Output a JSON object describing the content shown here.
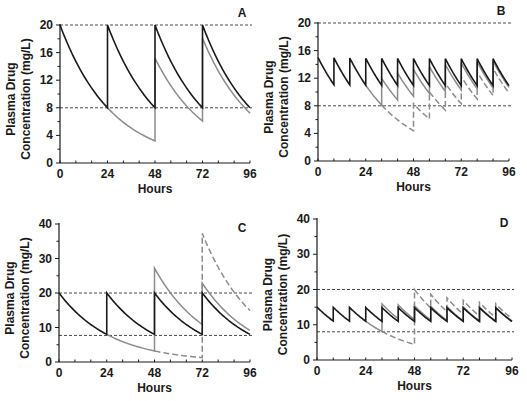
{
  "figure": {
    "width": 527,
    "height": 401,
    "colors": {
      "axis": "#1a1a1a",
      "primary": "#1a1a1a",
      "secondary": "#8c8c8c",
      "reference": "#333333"
    }
  },
  "chart_data": [
    {
      "panel": "A",
      "type": "line",
      "title": "A",
      "xlabel": "Hours",
      "ylabel": [
        "Plasma Drug",
        "Concentration (mg/L)"
      ],
      "xlim": [
        0,
        96
      ],
      "ylim": [
        0,
        20
      ],
      "xticks": [
        0,
        24,
        48,
        72,
        96
      ],
      "yticks": [
        0,
        4,
        8,
        12,
        16,
        20
      ],
      "x_minor_step": 8,
      "y_minor_step": 2,
      "reference_lines": [
        20,
        8
      ],
      "elimination_rate_per_h": 0.03818,
      "series": [
        {
          "name": "Regular dosing every 24 h",
          "color": "primary",
          "style": "solid",
          "initial": 20,
          "doses": [
            {
              "t": 24,
              "amount": 12
            },
            {
              "t": 48,
              "amount": 12
            },
            {
              "t": 72,
              "amount": 12
            }
          ]
        },
        {
          "name": "Missed dose at 24 h",
          "color": "secondary",
          "style": "solid",
          "initial": 20,
          "start": 24,
          "doses": [
            {
              "t": 48,
              "amount": 12
            },
            {
              "t": 72,
              "amount": 12
            }
          ]
        }
      ],
      "key_values": {
        "peak": 20,
        "trough": 8,
        "missed_trough_48h": 3.2,
        "peak_after_resume_48h": 15.2,
        "trough_72h": 6.1,
        "peak_72h": 18.1
      },
      "plot_px": {
        "x0": 60,
        "x1": 250,
        "y0": 163,
        "y1": 25
      }
    },
    {
      "panel": "B",
      "type": "line",
      "title": "B",
      "xlabel": "Hours",
      "ylabel": [
        "Plasma Drug",
        "Concentration (mg/L)"
      ],
      "xlim": [
        0,
        96
      ],
      "ylim": [
        0,
        20
      ],
      "xticks": [
        0,
        24,
        48,
        72,
        96
      ],
      "yticks": [
        0,
        4,
        8,
        12,
        16,
        20
      ],
      "x_minor_step": 8,
      "y_minor_step": 2,
      "reference_lines": [
        20,
        8
      ],
      "elimination_rate_per_h": 0.03818,
      "series": [
        {
          "name": "Regular dosing every 8 h",
          "color": "primary",
          "style": "solid",
          "initial": 15,
          "doses": [
            {
              "t": 8,
              "amount": 3.9
            },
            {
              "t": 16,
              "amount": 3.9
            },
            {
              "t": 24,
              "amount": 3.9
            },
            {
              "t": 32,
              "amount": 3.9
            },
            {
              "t": 40,
              "amount": 3.9
            },
            {
              "t": 48,
              "amount": 3.9
            },
            {
              "t": 56,
              "amount": 3.9
            },
            {
              "t": 64,
              "amount": 3.9
            },
            {
              "t": 72,
              "amount": 3.9
            },
            {
              "t": 80,
              "amount": 3.9
            },
            {
              "t": 88,
              "amount": 3.9
            }
          ]
        },
        {
          "name": "One missed dose at 24 h",
          "color": "secondary",
          "style": "solid",
          "initial": 15,
          "start": 24,
          "doses": [
            {
              "t": 8,
              "amount": 3.9
            },
            {
              "t": 16,
              "amount": 3.9
            },
            {
              "t": 32,
              "amount": 3.9
            },
            {
              "t": 40,
              "amount": 3.9
            },
            {
              "t": 48,
              "amount": 3.9
            },
            {
              "t": 56,
              "amount": 3.9
            },
            {
              "t": 64,
              "amount": 3.9
            },
            {
              "t": 72,
              "amount": 3.9
            },
            {
              "t": 80,
              "amount": 3.9
            },
            {
              "t": 88,
              "amount": 3.9
            }
          ]
        },
        {
          "name": "Missed doses 24-40 h",
          "color": "secondary",
          "style": "dashed",
          "initial": 15,
          "start": 32,
          "doses": [
            {
              "t": 8,
              "amount": 3.9
            },
            {
              "t": 16,
              "amount": 3.9
            },
            {
              "t": 48,
              "amount": 3.9
            },
            {
              "t": 56,
              "amount": 3.9
            },
            {
              "t": 64,
              "amount": 3.9
            },
            {
              "t": 72,
              "amount": 3.9
            },
            {
              "t": 80,
              "amount": 3.9
            },
            {
              "t": 88,
              "amount": 3.9
            }
          ]
        }
      ],
      "key_values": {
        "peak": 15.2,
        "trough": 11.2,
        "dashed_min_48h": 4.7
      },
      "plot_px": {
        "x0": 318,
        "x1": 509,
        "y0": 161,
        "y1": 23
      }
    },
    {
      "panel": "C",
      "type": "line",
      "title": "C",
      "xlabel": "Hours",
      "ylabel": [
        "Plasma Drug",
        "Concentration (mg/L)"
      ],
      "xlim": [
        0,
        96
      ],
      "ylim": [
        0,
        40
      ],
      "xticks": [
        0,
        24,
        48,
        72,
        96
      ],
      "yticks": [
        0,
        10,
        20,
        30,
        40
      ],
      "x_minor_step": 8,
      "y_minor_step": 5,
      "reference_lines": [
        20,
        7.7
      ],
      "elimination_rate_per_h": 0.03818,
      "series": [
        {
          "name": "Regular dosing every 24 h",
          "color": "primary",
          "style": "solid",
          "initial": 20,
          "doses": [
            {
              "t": 24,
              "amount": 12
            },
            {
              "t": 48,
              "amount": 12
            },
            {
              "t": 72,
              "amount": 12
            }
          ]
        },
        {
          "name": "Missed dose, double dose at 48 h",
          "color": "secondary",
          "style": "solid",
          "initial": 20,
          "start": 24,
          "doses": [
            {
              "t": 48,
              "amount": 24
            },
            {
              "t": 72,
              "amount": 12
            }
          ]
        },
        {
          "name": "Two missed doses, triple dose at 72 h",
          "color": "secondary",
          "style": "dashed",
          "initial": 20,
          "start": 48,
          "doses": [
            {
              "t": 72,
              "amount": 36
            }
          ]
        }
      ],
      "key_values": {
        "double_peak_48h": 27.2,
        "triple_peak_72h": 37.3,
        "dashed_trough_72h": 1.3,
        "dashed_end_96h": 14.9
      },
      "plot_px": {
        "x0": 59,
        "x1": 250,
        "y0": 362,
        "y1": 224
      }
    },
    {
      "panel": "D",
      "type": "line",
      "title": "D",
      "xlabel": "Hours",
      "ylabel": [
        "Plasma Drug",
        "Concentration (mg/L)"
      ],
      "xlim": [
        0,
        96
      ],
      "ylim": [
        0,
        40
      ],
      "xticks": [
        0,
        24,
        48,
        72,
        96
      ],
      "yticks": [
        0,
        10,
        20,
        30,
        40
      ],
      "x_minor_step": 8,
      "y_minor_step": 5,
      "reference_lines": [
        20,
        8
      ],
      "elimination_rate_per_h": 0.03818,
      "series": [
        {
          "name": "Regular dosing every 8 h",
          "color": "primary",
          "style": "solid",
          "initial": 15,
          "doses": [
            {
              "t": 8,
              "amount": 3.9
            },
            {
              "t": 16,
              "amount": 3.9
            },
            {
              "t": 24,
              "amount": 3.9
            },
            {
              "t": 32,
              "amount": 3.9
            },
            {
              "t": 40,
              "amount": 3.9
            },
            {
              "t": 48,
              "amount": 3.9
            },
            {
              "t": 56,
              "amount": 3.9
            },
            {
              "t": 64,
              "amount": 3.9
            },
            {
              "t": 72,
              "amount": 3.9
            },
            {
              "t": 80,
              "amount": 3.9
            },
            {
              "t": 88,
              "amount": 3.9
            }
          ]
        },
        {
          "name": "Missed dose, double dose next",
          "color": "secondary",
          "style": "solid",
          "initial": 15,
          "start": 24,
          "doses": [
            {
              "t": 8,
              "amount": 3.9
            },
            {
              "t": 16,
              "amount": 3.9
            },
            {
              "t": 32,
              "amount": 7.8
            },
            {
              "t": 40,
              "amount": 3.9
            },
            {
              "t": 48,
              "amount": 3.9
            },
            {
              "t": 56,
              "amount": 3.9
            },
            {
              "t": 64,
              "amount": 3.9
            },
            {
              "t": 72,
              "amount": 3.9
            },
            {
              "t": 80,
              "amount": 3.9
            },
            {
              "t": 88,
              "amount": 3.9
            }
          ]
        },
        {
          "name": "Missed doses, catch-up at 48 h",
          "color": "secondary",
          "style": "dashed",
          "initial": 15,
          "start": 32,
          "doses": [
            {
              "t": 8,
              "amount": 3.9
            },
            {
              "t": 16,
              "amount": 3.9
            },
            {
              "t": 48,
              "amount": 15.6
            },
            {
              "t": 56,
              "amount": 3.9
            },
            {
              "t": 64,
              "amount": 3.9
            },
            {
              "t": 72,
              "amount": 3.9
            },
            {
              "t": 80,
              "amount": 3.9
            },
            {
              "t": 88,
              "amount": 3.9
            }
          ]
        }
      ],
      "key_values": {
        "peak": 15.2,
        "trough": 11.2,
        "dashed_min_48h": 4.7,
        "dashed_peak_48h": 20.6
      },
      "plot_px": {
        "x0": 317,
        "x1": 512,
        "y0": 360,
        "y1": 219
      }
    }
  ]
}
